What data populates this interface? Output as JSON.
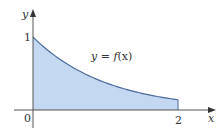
{
  "chart_data": {
    "type": "area",
    "title": "",
    "xlabel": "x",
    "ylabel": "y",
    "function_label": "y = f(x)",
    "x_ticks": [
      "0",
      "2"
    ],
    "y_ticks": [
      "1"
    ],
    "xlim": [
      0,
      2
    ],
    "ylim": [
      0,
      1
    ],
    "grid": false,
    "legend": null,
    "x": [
      0,
      0.25,
      0.5,
      0.75,
      1.0,
      1.25,
      1.5,
      1.75,
      2.0
    ],
    "values": [
      1.0,
      0.78,
      0.61,
      0.47,
      0.37,
      0.29,
      0.22,
      0.17,
      0.14
    ],
    "shaded_region": {
      "from_x": 0,
      "to_x": 2,
      "under": "f(x)"
    },
    "colors": {
      "fill": "#c4d8f2",
      "curve": "#4a6a9a",
      "axes": "#555555"
    }
  },
  "labels": {
    "y_axis": "y",
    "x_axis": "x",
    "origin": "0",
    "y_tick_1": "1",
    "x_tick_2": "2",
    "curve_label_prefix": "y = ",
    "curve_label_func": "f",
    "curve_label_arg": "(x)"
  }
}
